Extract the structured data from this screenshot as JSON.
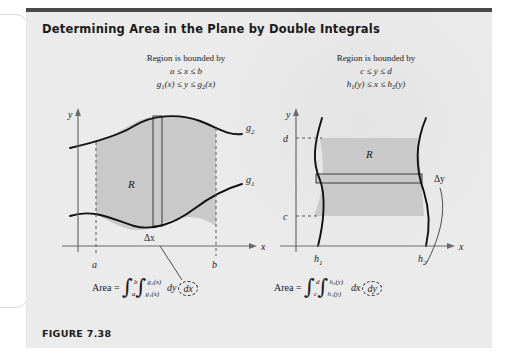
{
  "figure": {
    "title": "Determining Area in the Plane by Double Integrals",
    "caption": "FIGURE 7.38",
    "background_color": "#ebebeb",
    "region_fill_color": "#c9c9c9",
    "rule_color": "#4a4a4a"
  },
  "left_panel": {
    "header_line1": "Region is bounded by",
    "header_line2": "a ≤ x ≤ b",
    "header_line3_pre": "g",
    "header_line3_sub1": "1",
    "header_line3_mid": "(x) ≤ y ≤ g",
    "header_line3_sub2": "2",
    "header_line3_post": "(x)",
    "axis_y": "y",
    "axis_x": "x",
    "tick_a": "a",
    "tick_b": "b",
    "curve_upper": "g",
    "curve_upper_sub": "2",
    "curve_lower": "g",
    "curve_lower_sub": "1",
    "region_label": "R",
    "strip_label": "Δx",
    "formula_prefix": "Area =",
    "outer_lower": "a",
    "outer_upper": "b",
    "inner_lower": "g₁(x)",
    "inner_upper": "g₂(x)",
    "inner_diff": "dy",
    "outer_diff_circled": "dx"
  },
  "right_panel": {
    "header_line1": "Region is bounded by",
    "header_line2": "c ≤ y ≤ d",
    "header_line3_pre": "h",
    "header_line3_sub1": "1",
    "header_line3_mid": "(y) ≤ x ≤ h",
    "header_line3_sub2": "2",
    "header_line3_post": "(y)",
    "axis_y": "y",
    "axis_x": "x",
    "tick_c": "c",
    "tick_d": "d",
    "curve_left": "h",
    "curve_left_sub": "1",
    "curve_right": "h",
    "curve_right_sub": "2",
    "region_label": "R",
    "strip_label": "Δy",
    "formula_prefix": "Area =",
    "outer_lower": "c",
    "outer_upper": "d",
    "inner_lower": "h₁(y)",
    "inner_upper": "h₂(y)",
    "inner_diff": "dx",
    "outer_diff_circled": "dy"
  }
}
